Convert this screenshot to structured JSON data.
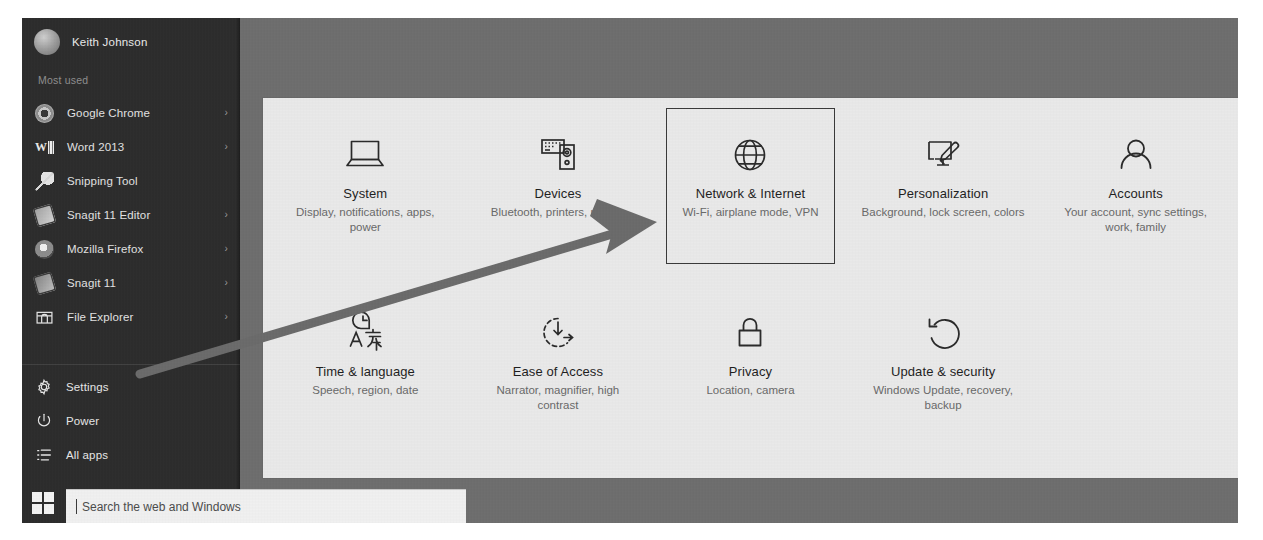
{
  "window": {
    "title": "Start menu",
    "panel_name": "Settings"
  },
  "sidebar": {
    "user": {
      "name": "Keith Johnson",
      "avatar_icon": "user-avatar-icon"
    },
    "section_label": "Most used",
    "apps": [
      {
        "label": "Google Chrome",
        "icon": "chrome-icon",
        "chevron": "›",
        "has_chevron": true
      },
      {
        "label": "Word 2013",
        "icon": "word-icon",
        "chevron": "›",
        "has_chevron": true
      },
      {
        "label": "Snipping Tool",
        "icon": "snipping-tool-icon",
        "chevron": "",
        "has_chevron": false
      },
      {
        "label": "Snagit 11 Editor",
        "icon": "snagit-editor-icon",
        "chevron": "›",
        "has_chevron": true
      },
      {
        "label": "Mozilla Firefox",
        "icon": "firefox-icon",
        "chevron": "›",
        "has_chevron": true
      },
      {
        "label": "Snagit 11",
        "icon": "snagit-icon",
        "chevron": "›",
        "has_chevron": true
      },
      {
        "label": "File Explorer",
        "icon": "folder-icon",
        "chevron": "›",
        "has_chevron": true
      }
    ],
    "system": [
      {
        "label": "Settings",
        "icon": "gear-icon"
      },
      {
        "label": "Power",
        "icon": "power-icon"
      },
      {
        "label": "All apps",
        "icon": "list-icon"
      }
    ]
  },
  "taskbar": {
    "start_button_icon": "windows-logo-icon",
    "search": {
      "value": "",
      "placeholder": "Search the web and Windows"
    }
  },
  "settings": {
    "selected_tile": "Network & Internet",
    "tiles": [
      {
        "title": "System",
        "sub": "Display, notifications, apps, power",
        "icon": "laptop-icon",
        "selected": false
      },
      {
        "title": "Devices",
        "sub": "Bluetooth, printers, mouse",
        "icon": "devices-icon",
        "selected": false
      },
      {
        "title": "Network & Internet",
        "sub": "Wi-Fi, airplane mode, VPN",
        "icon": "globe-icon",
        "selected": true
      },
      {
        "title": "Personalization",
        "sub": "Background, lock screen, colors",
        "icon": "paintbrush-icon",
        "selected": false
      },
      {
        "title": "Accounts",
        "sub": "Your account, sync settings, work, family",
        "icon": "person-icon",
        "selected": false
      },
      {
        "title": "Time & language",
        "sub": "Speech, region, date",
        "icon": "clock-language-icon",
        "selected": false
      },
      {
        "title": "Ease of Access",
        "sub": "Narrator, magnifier, high contrast",
        "icon": "ease-of-access-icon",
        "selected": false
      },
      {
        "title": "Privacy",
        "sub": "Location, camera",
        "icon": "lock-icon",
        "selected": false
      },
      {
        "title": "Update & security",
        "sub": "Windows Update, recovery, backup",
        "icon": "refresh-icon",
        "selected": false
      }
    ]
  },
  "annotation": {
    "arrow_icon": "pointer-arrow",
    "arrow_color": "#6b6b6b",
    "highlight_color": "#3a3a3a"
  },
  "colors": {
    "rail_bg": "#2d2d2d",
    "menu_bg": "#6e6e6e",
    "panel_bg": "#e9e9e9",
    "tile_title": "#1f1f1f",
    "tile_sub": "#6a6a6a",
    "search_bg": "#f0f0f0"
  }
}
